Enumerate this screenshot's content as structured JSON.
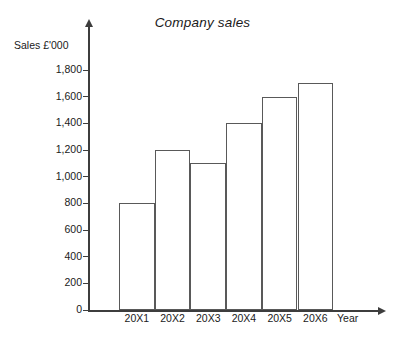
{
  "chart_data": {
    "type": "bar",
    "title": "Company sales",
    "xlabel": "Year",
    "ylabel": "Sales £'000",
    "categories": [
      "20X1",
      "20X2",
      "20X3",
      "20X4",
      "20X5",
      "20X6"
    ],
    "values": [
      800,
      1200,
      1100,
      1400,
      1600,
      1700
    ],
    "ylim": [
      0,
      1800
    ],
    "ytick_labels": [
      "1,800",
      "1,600",
      "1,400",
      "1,200",
      "1,000",
      "800",
      "600",
      "400",
      "200",
      "0"
    ],
    "ytick_values": [
      1800,
      1600,
      1400,
      1200,
      1000,
      800,
      600,
      400,
      200,
      0
    ],
    "grid": false,
    "legend": "none",
    "series": [
      {
        "name": "Sales",
        "values": [
          800,
          1200,
          1100,
          1400,
          1600,
          1700
        ]
      }
    ],
    "colors": {
      "bar_fill": "#ffffff",
      "bar_stroke": "#595959",
      "axis": "#3d3d3d",
      "text": "#1a1a1a",
      "background": "#ffffff"
    }
  }
}
